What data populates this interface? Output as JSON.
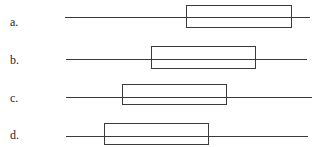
{
  "figure": {
    "width": 319,
    "height": 147,
    "background": "#ffffff",
    "stroke_color": "#3a3a3a",
    "text_color": "#262626"
  },
  "options": [
    {
      "label": "a.",
      "label_x": 10,
      "label_y": 16,
      "line": {
        "x": 65,
        "y": 17,
        "length": 245
      },
      "box": {
        "x": 186,
        "y": 5,
        "width": 106,
        "height": 23
      }
    },
    {
      "label": "b.",
      "label_x": 10,
      "label_y": 54,
      "line": {
        "x": 66,
        "y": 59,
        "length": 241
      },
      "box": {
        "x": 151,
        "y": 46,
        "width": 105,
        "height": 23
      }
    },
    {
      "label": "c.",
      "label_x": 10,
      "label_y": 92,
      "line": {
        "x": 66,
        "y": 97,
        "length": 246
      },
      "box": {
        "x": 122,
        "y": 84,
        "width": 105,
        "height": 21
      }
    },
    {
      "label": "d.",
      "label_x": 10,
      "label_y": 129,
      "line": {
        "x": 66,
        "y": 136,
        "length": 242
      },
      "box": {
        "x": 104,
        "y": 123,
        "width": 105,
        "height": 22
      }
    }
  ]
}
